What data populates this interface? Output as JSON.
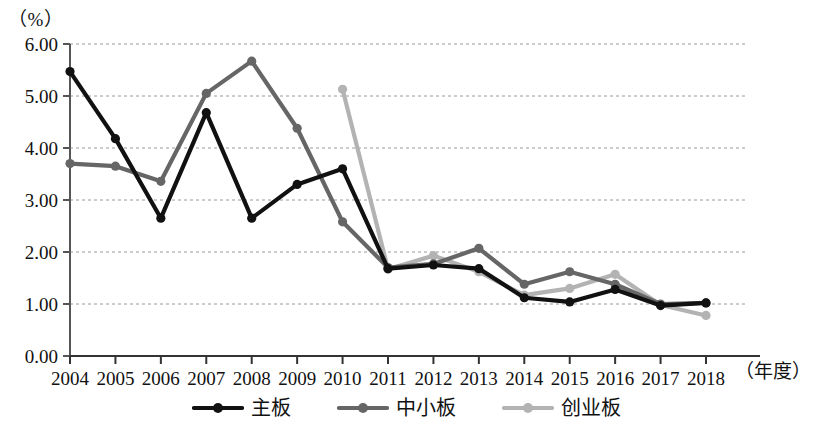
{
  "chart_data": {
    "type": "line",
    "title": "",
    "ylabel": "（%）",
    "xlabel": "（年度）",
    "ylim": [
      0.0,
      6.0
    ],
    "ytick_step": 1.0,
    "ytick_labels": [
      "0.00",
      "1.00",
      "2.00",
      "3.00",
      "4.00",
      "5.00",
      "6.00"
    ],
    "grid": true,
    "grid_style": "dashed-horizontal",
    "legend_position": "bottom-center",
    "categories": [
      "2004",
      "2005",
      "2006",
      "2007",
      "2008",
      "2009",
      "2010",
      "2011",
      "2012",
      "2013",
      "2014",
      "2015",
      "2016",
      "2017",
      "2018"
    ],
    "series": [
      {
        "name": "主板",
        "color": "#111111",
        "marker": "circle",
        "values": [
          5.47,
          4.18,
          2.65,
          4.68,
          2.65,
          3.3,
          3.6,
          1.68,
          1.75,
          1.68,
          1.12,
          1.04,
          1.28,
          0.97,
          1.02
        ]
      },
      {
        "name": "中小板",
        "color": "#666666",
        "marker": "circle",
        "values": [
          3.7,
          3.65,
          3.36,
          5.05,
          5.67,
          4.38,
          2.58,
          1.7,
          1.77,
          2.07,
          1.38,
          1.62,
          1.38,
          1.0,
          1.02
        ]
      },
      {
        "name": "创业板",
        "color": "#b3b3b3",
        "marker": "circle",
        "values": [
          null,
          null,
          null,
          null,
          null,
          null,
          5.13,
          1.67,
          1.93,
          1.62,
          1.17,
          1.3,
          1.57,
          0.98,
          0.78
        ]
      }
    ]
  },
  "legend": {
    "items": [
      {
        "label": "主板",
        "color": "#111111"
      },
      {
        "label": "中小板",
        "color": "#666666"
      },
      {
        "label": "创业板",
        "color": "#b3b3b3"
      }
    ]
  },
  "axes": {
    "y_unit": "（%）",
    "x_title": "（年度）"
  }
}
